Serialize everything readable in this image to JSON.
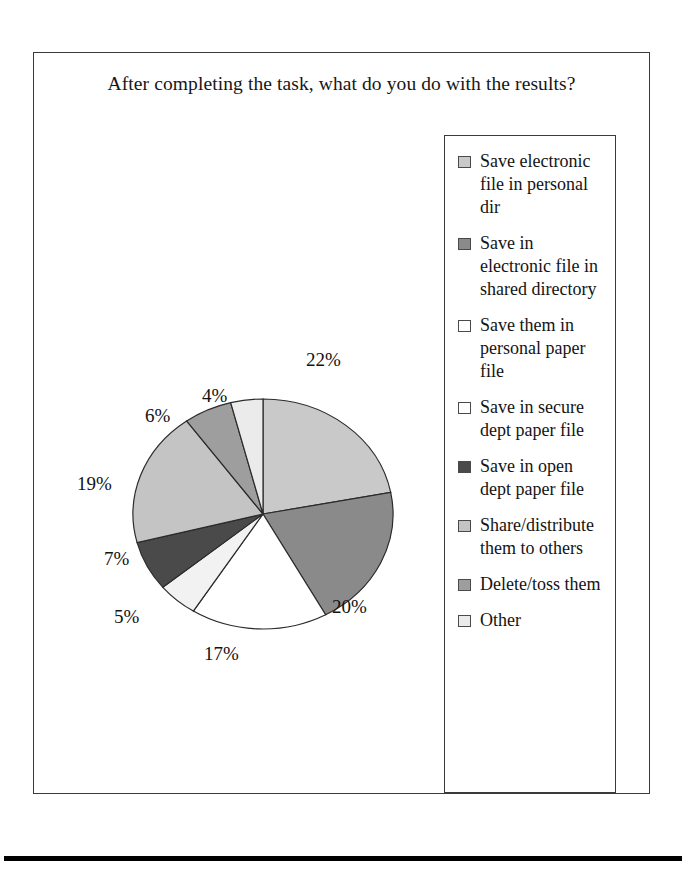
{
  "chart_data": {
    "type": "pie",
    "title": "After completing the task, what do you do with the results?",
    "subtitle": "",
    "xlabel": "",
    "ylabel": "",
    "legend_position": "right",
    "grid": false,
    "start_angle_deg": 0,
    "direction": "clockwise",
    "categories": [
      "Save electronic file in personal dir",
      "Save in electronic file in shared directory",
      "Save them in personal paper file",
      "Save in secure dept paper file",
      "Save in open dept paper file",
      "Share/distribute them to others",
      "Delete/toss them",
      "Other"
    ],
    "values": [
      22,
      20,
      17,
      5,
      7,
      19,
      6,
      4
    ],
    "value_labels": [
      "22%",
      "20%",
      "17%",
      "5%",
      "7%",
      "19%",
      "6%",
      "4%"
    ],
    "slice_colors": [
      "#c9c9c9",
      "#8a8a8a",
      "#ffffff",
      "#f2f2f2",
      "#4a4a4a",
      "#c4c4c4",
      "#9e9e9e",
      "#ebebeb"
    ],
    "units": "percent"
  },
  "title": {
    "text": "After completing the task, what do you do with the results?"
  },
  "legend": {
    "items": [
      {
        "label": "Save electronic file in personal dir",
        "swatch": "#c9c9c9",
        "percent": "22%"
      },
      {
        "label": "Save in electronic file in shared directory",
        "swatch": "#8a8a8a",
        "percent": "20%"
      },
      {
        "label": "Save them in personal paper file",
        "swatch": "#ffffff",
        "percent": "17%"
      },
      {
        "label": "Save in secure dept paper file",
        "swatch": "#ffffff",
        "percent": "5%"
      },
      {
        "label": "Save in open dept paper file",
        "swatch": "#4a4a4a",
        "percent": "7%"
      },
      {
        "label": "Share/distribute them to others",
        "swatch": "#c4c4c4",
        "percent": "19%"
      },
      {
        "label": "Delete/toss them",
        "swatch": "#9e9e9e",
        "percent": "6%"
      },
      {
        "label": "Other",
        "swatch": "#ebebeb",
        "percent": "4%"
      }
    ]
  },
  "pie_labels": [
    {
      "text": "22%",
      "left": 272,
      "top": 236
    },
    {
      "text": "20%",
      "left": 298,
      "top": 483
    },
    {
      "text": "17%",
      "left": 170,
      "top": 530
    },
    {
      "text": "5%",
      "left": 80,
      "top": 493
    },
    {
      "text": "7%",
      "left": 70,
      "top": 435
    },
    {
      "text": "19%",
      "left": 43,
      "top": 360
    },
    {
      "text": "6%",
      "left": 111,
      "top": 292
    },
    {
      "text": "4%",
      "left": 168,
      "top": 272
    }
  ],
  "colors": {
    "frame_border": "#3a3a3a",
    "text": "#141414",
    "rule": "#000000"
  }
}
